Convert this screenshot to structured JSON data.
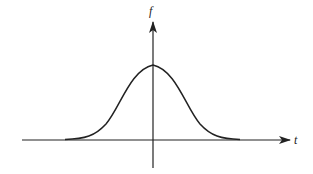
{
  "diagram": {
    "type": "bell-curve",
    "y_axis_label": "f",
    "x_axis_label": "t",
    "colors": {
      "stroke": "#222222",
      "background": "#ffffff"
    }
  }
}
